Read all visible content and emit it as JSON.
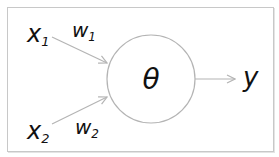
{
  "diagram": {
    "type": "perceptron",
    "inputs": [
      {
        "symbol": "x",
        "subscript": "1"
      },
      {
        "symbol": "x",
        "subscript": "2"
      }
    ],
    "weights": [
      {
        "symbol": "w",
        "subscript": "1"
      },
      {
        "symbol": "w",
        "subscript": "2"
      }
    ],
    "node": {
      "label": "θ"
    },
    "output": {
      "label": "y"
    },
    "colors": {
      "stroke": "#b4b4b4",
      "text": "#111111",
      "border": "#c8c8c8"
    }
  }
}
